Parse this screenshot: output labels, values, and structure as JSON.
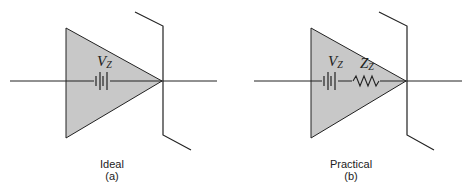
{
  "figure": {
    "panels": [
      {
        "id": "a",
        "caption": "Ideal",
        "sublabel": "(a)",
        "components": [
          {
            "type": "battery",
            "label": "V",
            "subscript": "Z"
          }
        ]
      },
      {
        "id": "b",
        "caption": "Practical",
        "sublabel": "(b)",
        "components": [
          {
            "type": "battery",
            "label": "V",
            "subscript": "Z"
          },
          {
            "type": "resistor",
            "label": "Z",
            "subscript": "Z"
          }
        ]
      }
    ],
    "colors": {
      "triangle_fill": "#c8c8c8",
      "stroke": "#222222",
      "background": "#ffffff"
    }
  }
}
